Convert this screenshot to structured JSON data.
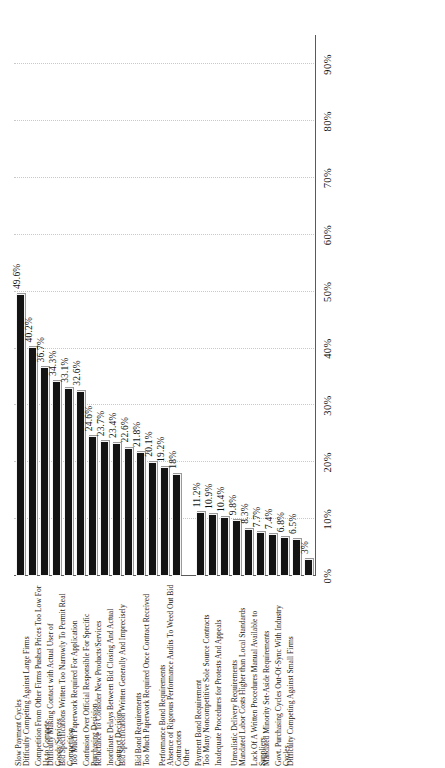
{
  "chart_data": {
    "type": "bar",
    "orientation": "horizontal",
    "title": "",
    "subtitle": "",
    "xlabel": "",
    "ylabel": "",
    "xlim": [
      0,
      95
    ],
    "grid": true,
    "legend": "none",
    "xticks": [
      "0%",
      "10%",
      "20%",
      "30%",
      "40%",
      "50%",
      "60%",
      "70%",
      "80%",
      "90%"
    ],
    "xtick_values": [
      0,
      10,
      20,
      30,
      40,
      50,
      60,
      70,
      80,
      90
    ],
    "categories": [
      "Slow Payment Cycles",
      "Difficulty Competing Against Large Firms",
      "Competition From Other Firms Pushes Prices Too Low For Us to Compete",
      "Difficulty Making Contact with Actual User of Goods/Services",
      "Bid Specifications Written Too Narrowly To Permit Real Competition",
      "Too Much Paperwork Required For Application",
      "Confusion Over Official Responsible For Specific Purchasing Decision",
      "Reluctance To Consider New Products/Services",
      "Inordinate Delays Between Bid Closing And Actual Contract Decision",
      "Bid Specification Written Generally And Imprecisely",
      "Bid Bond Requirements",
      "Too Much Paperwork Required Once Contract Received",
      "Performance Bond Requirements",
      "Absence of Rigorous Performance Audits To Weed Out Bid Contractors",
      "Other",
      "Payment Bond Requirement",
      "Too Many Noncompetitive Sole Source Contracts",
      "Inadequate Procedures for Protests And Appeals",
      "Unrealistic Delivery Requirements",
      "Mandated Labor Costs Higher than Local Standards",
      "Lack Of A Written Procedures Manual Available to Suppliers",
      "Mandated Minority Set-Aside Requirements",
      "Govt. Purchasing Cycles Out-Of-Sync With Industry Cycles",
      "Difficulty Competing Against Small Firms"
    ],
    "values": [
      49.6,
      40.2,
      36.7,
      34.3,
      33.1,
      32.6,
      24.6,
      23.7,
      23.4,
      22.6,
      21.8,
      20.1,
      19.2,
      18,
      null,
      11.2,
      10.9,
      10.4,
      9.8,
      8.3,
      7.7,
      7.4,
      6.8,
      6.5
    ],
    "value_labels": [
      "49.6%",
      "40.2%",
      "36.7%",
      "34.3%",
      "33.1%",
      "32.6%",
      "24.6%",
      "23.7%",
      "23.4%",
      "22.6%",
      "21.8%",
      "20.1%",
      "19.2%",
      "18%",
      "",
      "11.2%",
      "10.9%",
      "10.4%",
      "9.8%",
      "8.3%",
      "7.7%",
      "7.4%",
      "6.8%",
      "6.5%"
    ],
    "extra_bar": {
      "label": "3%",
      "value": 3
    },
    "bar_color": "#141414",
    "grid_color": "#c9c9c9",
    "axis_color": "#5a5a5a"
  }
}
